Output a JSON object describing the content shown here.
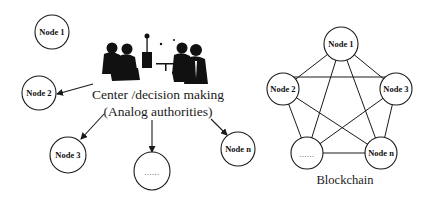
{
  "centralized": {
    "caption_line1": "Center /decision making",
    "caption_line2": "(Analog authorities)",
    "icon": "meeting-people-icon",
    "nodes": [
      {
        "label": "Node 1"
      },
      {
        "label": "Node 2"
      },
      {
        "label": "Node 3"
      },
      {
        "label": "......"
      },
      {
        "label": "Node n"
      }
    ]
  },
  "blockchain": {
    "caption": "Blockchain",
    "nodes": [
      {
        "label": "Node 1"
      },
      {
        "label": "Node 2"
      },
      {
        "label": "Node 3"
      },
      {
        "label": "......"
      },
      {
        "label": "Node n"
      }
    ]
  },
  "colors": {
    "stroke": "#1a1a1a",
    "background": "#ffffff"
  }
}
